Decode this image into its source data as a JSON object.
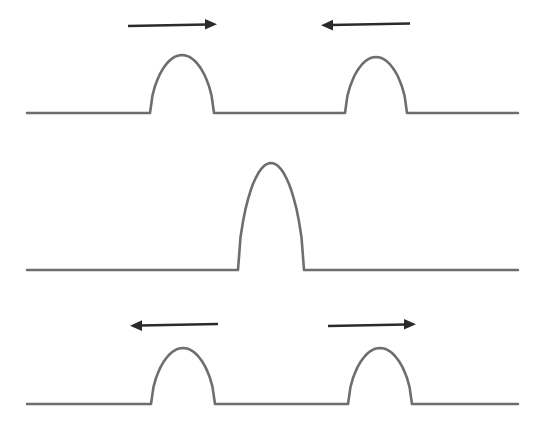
{
  "figure": {
    "background_color": "#ffffff",
    "wave_color": "#6e6e6e",
    "arrow_color": "#2b2b2b",
    "wave_stroke_width": 2.6,
    "arrow_stroke_width": 2.6
  },
  "chart_data": {
    "type": "line",
    "subtitle": "",
    "xlabel": "",
    "ylabel": "",
    "xlim": [
      0,
      537
    ],
    "ylim": [
      442,
      0
    ],
    "grid": false,
    "legend": "none",
    "annotations": [
      {
        "panel": 1,
        "type": "arrow",
        "label": "pulse-moving-right",
        "direction": "right",
        "x1": 128,
        "x2": 215,
        "y": 25
      },
      {
        "panel": 1,
        "type": "arrow",
        "label": "pulse-moving-left",
        "direction": "left",
        "x1": 322,
        "x2": 410,
        "y": 25
      },
      {
        "panel": 3,
        "type": "arrow",
        "label": "pulse-moving-left",
        "direction": "left",
        "x1": 130,
        "x2": 218,
        "y": 325
      },
      {
        "panel": 3,
        "type": "arrow",
        "label": "pulse-moving-right",
        "direction": "right",
        "x1": 328,
        "x2": 415,
        "y": 325
      }
    ],
    "panels": [
      {
        "index": 1,
        "name": "pulses-approaching",
        "baseline_y": 113,
        "x_start": 27,
        "x_end": 518,
        "pulses": [
          {
            "name": "left-pulse",
            "center_x": 182,
            "peak_y": 55,
            "amplitude": 58,
            "half_width": 32,
            "direction": "right"
          },
          {
            "name": "right-pulse",
            "center_x": 376,
            "peak_y": 57,
            "amplitude": 56,
            "half_width": 31,
            "direction": "left"
          }
        ]
      },
      {
        "index": 2,
        "name": "pulses-overlapping",
        "baseline_y": 270,
        "x_start": 27,
        "x_end": 518,
        "pulses": [
          {
            "name": "combined-pulse",
            "center_x": 271,
            "peak_y": 163,
            "amplitude": 107,
            "half_width": 33,
            "direction": "none"
          }
        ]
      },
      {
        "index": 3,
        "name": "pulses-separating",
        "baseline_y": 404,
        "x_start": 27,
        "x_end": 518,
        "pulses": [
          {
            "name": "left-pulse",
            "center_x": 183,
            "peak_y": 348,
            "amplitude": 56,
            "half_width": 32,
            "direction": "left"
          },
          {
            "name": "right-pulse",
            "center_x": 380,
            "peak_y": 348,
            "amplitude": 56,
            "half_width": 32,
            "direction": "right"
          }
        ]
      }
    ]
  }
}
